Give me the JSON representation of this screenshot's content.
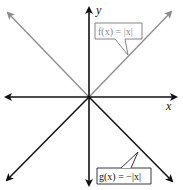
{
  "diagram": {
    "title": "",
    "axes": {
      "x_label": "x",
      "y_label": "y"
    },
    "functions": [
      {
        "name": "f",
        "label": "f(x) = |x|",
        "label_parts": {
          "lhs": "f(x)",
          "eq": "=",
          "rhs": "|x|"
        },
        "expression": "|x|",
        "color": "#8c8c8c"
      },
      {
        "name": "g",
        "label": "g(x) = −|x|",
        "label_parts": {
          "lhs": "g(x)",
          "eq": "=",
          "rhs": "−|x|"
        },
        "expression": "-|x|",
        "color": "#111111"
      }
    ],
    "colors": {
      "axis": "#111111",
      "f_line": "#8c8c8c",
      "g_line": "#111111",
      "background": "#ffffff"
    }
  }
}
